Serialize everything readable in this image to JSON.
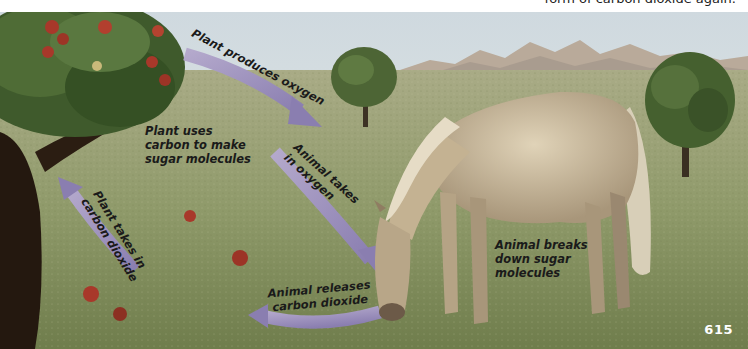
{
  "header": {
    "caption_fragment": "form of carbon dioxide again."
  },
  "diagram": {
    "labels": {
      "plant_produces_oxygen": "Plant produces oxygen",
      "plant_uses_carbon": [
        "Plant uses",
        "carbon to make",
        "sugar molecules"
      ],
      "animal_takes_oxygen": [
        "Animal takes",
        "in oxygen"
      ],
      "plant_takes_co2": [
        "Plant takes in",
        "carbon dioxide"
      ],
      "animal_releases_co2": [
        "Animal releases",
        "carbon dioxide"
      ],
      "animal_breaks_down": [
        "Animal breaks",
        "down sugar",
        "molecules"
      ]
    },
    "arrows": [
      {
        "from": "tree",
        "to": "horse",
        "meaning": "oxygen"
      },
      {
        "from": "horse",
        "to": "tree",
        "meaning": "carbon dioxide"
      }
    ],
    "colors": {
      "sky": "#dfe6ea",
      "grass": "#8f9a6a",
      "arrow": "#9a8fb8",
      "tree_foliage": "#3f5a2c",
      "apple": "#a8382a",
      "horse": "#c9b89a",
      "mountains": "#b8a898"
    }
  },
  "footer": {
    "page_number": "615"
  }
}
